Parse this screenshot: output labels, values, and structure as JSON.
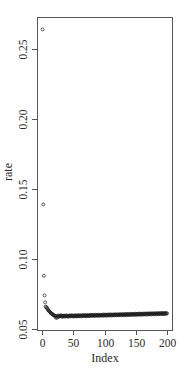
{
  "chart_data": {
    "type": "scatter",
    "title": "",
    "xlabel": "Index",
    "ylabel": "rate",
    "xlim": [
      -4,
      204
    ],
    "ylim": [
      0.05,
      0.27
    ],
    "x_ticks": [
      0,
      50,
      100,
      150,
      200
    ],
    "x_tick_labels": [
      "0",
      "50",
      "100",
      "150",
      "200"
    ],
    "y_ticks": [
      0.05,
      0.1,
      0.15,
      0.2,
      0.25
    ],
    "y_tick_labels": [
      "0.05",
      "0.10",
      "0.15",
      "0.20",
      "0.25"
    ],
    "grid": false,
    "legend": null,
    "marker": "open-circle",
    "series": [
      {
        "name": "rate",
        "x_start": 1,
        "values": [
          0.264,
          0.139,
          0.088,
          0.074,
          0.069,
          0.066,
          0.0655,
          0.065,
          0.064,
          0.0635,
          0.063,
          0.0625,
          0.062,
          0.0615,
          0.061,
          0.0608,
          0.0605,
          0.06,
          0.0598,
          0.0596,
          0.0594,
          0.0582,
          0.0592,
          0.058,
          0.059,
          0.0596,
          0.0588,
          0.0594,
          0.0592,
          0.0598,
          0.059,
          0.0595,
          0.0587,
          0.0593,
          0.0596,
          0.0589,
          0.0594,
          0.0591,
          0.0597,
          0.059,
          0.0594,
          0.0588,
          0.0595,
          0.0592,
          0.0597,
          0.059,
          0.0594,
          0.0598,
          0.0591,
          0.0595,
          0.0589,
          0.0596,
          0.0593,
          0.0598,
          0.059,
          0.0595,
          0.0592,
          0.0599,
          0.0591,
          0.0596,
          0.0593,
          0.0598,
          0.059,
          0.0596,
          0.0594,
          0.06,
          0.0592,
          0.0597,
          0.0594,
          0.0599,
          0.0591,
          0.0597,
          0.0595,
          0.06,
          0.0592,
          0.0598,
          0.0595,
          0.0601,
          0.0593,
          0.0598,
          0.0596,
          0.0601,
          0.0593,
          0.0599,
          0.0596,
          0.0602,
          0.0594,
          0.0599,
          0.0596,
          0.0602,
          0.0594,
          0.06,
          0.0597,
          0.0602,
          0.0595,
          0.06,
          0.0597,
          0.0603,
          0.0595,
          0.0601,
          0.0598,
          0.0603,
          0.0595,
          0.0601,
          0.0598,
          0.0604,
          0.0596,
          0.0602,
          0.0599,
          0.0604,
          0.0596,
          0.0602,
          0.0599,
          0.0604,
          0.0597,
          0.0603,
          0.06,
          0.0605,
          0.0597,
          0.0603,
          0.06,
          0.0605,
          0.0598,
          0.0604,
          0.0601,
          0.0606,
          0.0598,
          0.0604,
          0.0601,
          0.0606,
          0.0599,
          0.0605,
          0.0602,
          0.0607,
          0.0599,
          0.0605,
          0.0602,
          0.0607,
          0.06,
          0.0606,
          0.0603,
          0.0608,
          0.06,
          0.0606,
          0.0603,
          0.0608,
          0.0601,
          0.0607,
          0.0604,
          0.0609,
          0.0601,
          0.0607,
          0.0604,
          0.0609,
          0.0602,
          0.0608,
          0.0605,
          0.061,
          0.0602,
          0.0608,
          0.0605,
          0.061,
          0.0603,
          0.0609,
          0.0606,
          0.0611,
          0.0603,
          0.0609,
          0.0606,
          0.0611,
          0.0604,
          0.061,
          0.0607,
          0.0612,
          0.0604,
          0.061,
          0.0607,
          0.0612,
          0.0605,
          0.0611,
          0.0608,
          0.0613,
          0.0605,
          0.0611,
          0.0608,
          0.0613,
          0.0606,
          0.0612,
          0.0609,
          0.0614,
          0.0606,
          0.0612,
          0.0609,
          0.0614,
          0.0607,
          0.0613,
          0.061,
          0.0614,
          0.0608,
          0.0612
        ]
      }
    ]
  },
  "layout": {
    "plot_box": {
      "left": 37,
      "top": 17,
      "right": 172,
      "bottom": 330
    },
    "x_map": {
      "origin_px": 42,
      "px_per_unit": 0.625
    },
    "y_map": {
      "ref_value": 0.25,
      "ref_px": 49,
      "px_per_unit": 1400
    },
    "colors": {
      "axis": "#555555",
      "point": "#1a1a1a",
      "text": "#2a2a2a"
    }
  }
}
